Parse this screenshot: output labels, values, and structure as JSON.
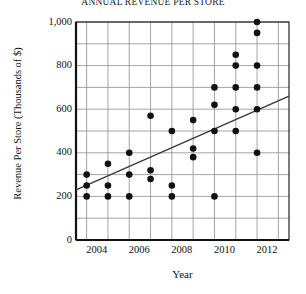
{
  "chart_data": {
    "type": "scatter",
    "title": "ANNUAL REVENUE PER STORE",
    "xlabel": "Year",
    "ylabel": "Revenue Per Store (Thousands of $)",
    "xlim": [
      2003.5,
      2013.5
    ],
    "ylim": [
      0,
      1000
    ],
    "grid": true,
    "legend": false,
    "y_ticks": [
      0,
      200,
      400,
      600,
      800,
      1000
    ],
    "y_tick_labels": [
      "0",
      "200",
      "400",
      "600",
      "800",
      "1,000"
    ],
    "y_minor_step": 100,
    "x_ticks": [
      2004,
      2005,
      2006,
      2007,
      2008,
      2009,
      2010,
      2011,
      2012,
      2013
    ],
    "x_tick_labels": [
      "2004",
      "",
      "2006",
      "",
      "2008",
      "",
      "2010",
      "",
      "2012",
      ""
    ],
    "x_labeled_ticks": [
      2004,
      2006,
      2008,
      2010,
      2012
    ],
    "points": [
      {
        "x": 2004,
        "y": 200
      },
      {
        "x": 2004,
        "y": 250
      },
      {
        "x": 2004,
        "y": 300
      },
      {
        "x": 2005,
        "y": 200
      },
      {
        "x": 2005,
        "y": 250
      },
      {
        "x": 2005,
        "y": 350
      },
      {
        "x": 2006,
        "y": 200
      },
      {
        "x": 2006,
        "y": 300
      },
      {
        "x": 2006,
        "y": 400
      },
      {
        "x": 2007,
        "y": 280
      },
      {
        "x": 2007,
        "y": 320
      },
      {
        "x": 2007,
        "y": 570
      },
      {
        "x": 2008,
        "y": 200
      },
      {
        "x": 2008,
        "y": 250
      },
      {
        "x": 2008,
        "y": 500
      },
      {
        "x": 2009,
        "y": 380
      },
      {
        "x": 2009,
        "y": 420
      },
      {
        "x": 2009,
        "y": 550
      },
      {
        "x": 2010,
        "y": 200
      },
      {
        "x": 2010,
        "y": 500
      },
      {
        "x": 2010,
        "y": 620
      },
      {
        "x": 2010,
        "y": 700
      },
      {
        "x": 2011,
        "y": 500
      },
      {
        "x": 2011,
        "y": 600
      },
      {
        "x": 2011,
        "y": 700
      },
      {
        "x": 2011,
        "y": 800
      },
      {
        "x": 2011,
        "y": 850
      },
      {
        "x": 2012,
        "y": 400
      },
      {
        "x": 2012,
        "y": 600
      },
      {
        "x": 2012,
        "y": 700
      },
      {
        "x": 2012,
        "y": 800
      },
      {
        "x": 2012,
        "y": 950
      },
      {
        "x": 2012,
        "y": 1000
      }
    ],
    "trend_line": {
      "x_start": 2003.5,
      "y_start": 230,
      "x_end": 2013.5,
      "y_end": 660
    },
    "colors": {
      "point": "#111111",
      "trend": "#3a3a3a",
      "grid": "#9a9a9a",
      "axis": "#111111",
      "background": "#ffffff"
    }
  }
}
